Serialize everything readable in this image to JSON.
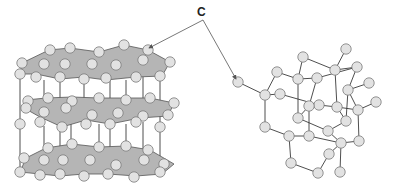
{
  "label": {
    "text": "C",
    "x": 197,
    "y": 5
  },
  "colors": {
    "atom_fill": "#e2e2e2",
    "atom_stroke": "#7a7a7a",
    "bond": "#3a3a3a",
    "sheet_fill": "#b5b5b5",
    "sheet_stroke": "#555555",
    "arrow": "#555555"
  },
  "arrows": [
    {
      "name": "arrow-to-graphite",
      "from": [
        203,
        20
      ],
      "to": [
        149,
        48
      ]
    },
    {
      "name": "arrow-to-diamond",
      "from": [
        203,
        20
      ],
      "to": [
        236,
        79
      ]
    }
  ],
  "graphite": {
    "name": "graphite-structure",
    "layers": [
      {
        "sheet": [
          [
            22,
            63
          ],
          [
            49,
            50
          ],
          [
            70,
            48
          ],
          [
            99,
            52
          ],
          [
            124,
            45
          ],
          [
            148,
            50
          ],
          [
            170,
            62
          ],
          [
            162,
            76
          ],
          [
            136,
            77
          ],
          [
            106,
            80
          ],
          [
            84,
            77
          ],
          [
            60,
            79
          ],
          [
            36,
            74
          ],
          [
            20,
            74
          ]
        ],
        "atoms": [
          [
            50,
            50
          ],
          [
            70,
            48
          ],
          [
            99,
            52
          ],
          [
            124,
            45
          ],
          [
            148,
            50
          ],
          [
            22,
            63
          ],
          [
            44,
            64
          ],
          [
            65,
            64
          ],
          [
            92,
            64
          ],
          [
            116,
            65
          ],
          [
            143,
            60
          ],
          [
            170,
            62
          ],
          [
            20,
            74
          ],
          [
            36,
            77
          ],
          [
            60,
            77
          ],
          [
            84,
            79
          ],
          [
            106,
            78
          ],
          [
            136,
            77
          ],
          [
            160,
            76
          ]
        ]
      },
      {
        "sheet": [
          [
            26,
            100
          ],
          [
            46,
            98
          ],
          [
            72,
            97
          ],
          [
            99,
            98
          ],
          [
            126,
            98
          ],
          [
            150,
            98
          ],
          [
            174,
            103
          ],
          [
            168,
            116
          ],
          [
            140,
            118
          ],
          [
            110,
            124
          ],
          [
            86,
            120
          ],
          [
            62,
            127
          ],
          [
            40,
            117
          ],
          [
            24,
            108
          ]
        ],
        "atoms": [
          [
            28,
            101
          ],
          [
            48,
            98
          ],
          [
            72,
            101
          ],
          [
            99,
            98
          ],
          [
            126,
            100
          ],
          [
            150,
            98
          ],
          [
            174,
            103
          ],
          [
            26,
            108
          ],
          [
            44,
            112
          ],
          [
            66,
            108
          ],
          [
            92,
            115
          ],
          [
            118,
            113
          ],
          [
            143,
            116
          ],
          [
            168,
            115
          ],
          [
            20,
            124
          ],
          [
            40,
            122
          ],
          [
            62,
            127
          ],
          [
            86,
            124
          ],
          [
            110,
            124
          ],
          [
            136,
            122
          ],
          [
            160,
            127
          ]
        ]
      },
      {
        "sheet": [
          [
            26,
            158
          ],
          [
            46,
            148
          ],
          [
            72,
            144
          ],
          [
            99,
            147
          ],
          [
            126,
            146
          ],
          [
            150,
            150
          ],
          [
            174,
            164
          ],
          [
            162,
            174
          ],
          [
            136,
            176
          ],
          [
            108,
            174
          ],
          [
            84,
            174
          ],
          [
            60,
            176
          ],
          [
            40,
            174
          ],
          [
            20,
            172
          ]
        ],
        "atoms": [
          [
            48,
            148
          ],
          [
            72,
            144
          ],
          [
            99,
            147
          ],
          [
            126,
            146
          ],
          [
            148,
            150
          ],
          [
            24,
            158
          ],
          [
            44,
            160
          ],
          [
            63,
            160
          ],
          [
            90,
            160
          ],
          [
            116,
            165
          ],
          [
            144,
            160
          ],
          [
            164,
            164
          ],
          [
            20,
            172
          ],
          [
            40,
            175
          ],
          [
            60,
            174
          ],
          [
            84,
            176
          ],
          [
            108,
            174
          ],
          [
            134,
            177
          ],
          [
            160,
            172
          ]
        ]
      }
    ],
    "pillars": [
      [
        [
          20,
          74
        ],
        [
          20,
          172
        ]
      ],
      [
        [
          44,
          80
        ],
        [
          44,
          112
        ]
      ],
      [
        [
          60,
          79
        ],
        [
          60,
          174
        ]
      ],
      [
        [
          71,
          104
        ],
        [
          71,
          158
        ]
      ],
      [
        [
          84,
          82
        ],
        [
          84,
          112
        ]
      ],
      [
        [
          110,
          80
        ],
        [
          110,
          174
        ]
      ],
      [
        [
          126,
          80
        ],
        [
          126,
          112
        ]
      ],
      [
        [
          143,
          77
        ],
        [
          143,
          116
        ]
      ],
      [
        [
          160,
          79
        ],
        [
          160,
          172
        ]
      ],
      [
        [
          44,
          126
        ],
        [
          44,
          160
        ]
      ],
      [
        [
          126,
          124
        ],
        [
          126,
          146
        ]
      ],
      [
        [
          143,
          122
        ],
        [
          143,
          160
        ]
      ],
      [
        [
          99,
          124
        ],
        [
          99,
          147
        ]
      ]
    ]
  },
  "diamond": {
    "name": "diamond-structure",
    "atoms": [
      [
        238,
        82
      ],
      [
        265,
        95
      ],
      [
        277,
        72
      ],
      [
        298,
        79
      ],
      [
        303,
        57
      ],
      [
        280,
        94
      ],
      [
        317,
        78
      ],
      [
        335,
        70
      ],
      [
        346,
        49
      ],
      [
        357,
        67
      ],
      [
        348,
        90
      ],
      [
        369,
        83
      ],
      [
        376,
        102
      ],
      [
        358,
        110
      ],
      [
        337,
        107
      ],
      [
        319,
        105
      ],
      [
        309,
        106
      ],
      [
        298,
        118
      ],
      [
        265,
        127
      ],
      [
        289,
        136
      ],
      [
        309,
        136
      ],
      [
        328,
        131
      ],
      [
        346,
        121
      ],
      [
        341,
        143
      ],
      [
        359,
        141
      ],
      [
        329,
        154
      ],
      [
        291,
        163
      ],
      [
        318,
        173
      ],
      [
        340,
        172
      ]
    ],
    "bonds": [
      [
        0,
        1
      ],
      [
        1,
        2
      ],
      [
        2,
        3
      ],
      [
        3,
        4
      ],
      [
        4,
        7
      ],
      [
        7,
        8
      ],
      [
        7,
        9
      ],
      [
        9,
        10
      ],
      [
        10,
        11
      ],
      [
        12,
        13
      ],
      [
        3,
        6
      ],
      [
        6,
        16
      ],
      [
        1,
        5
      ],
      [
        5,
        15
      ],
      [
        15,
        14
      ],
      [
        14,
        13
      ],
      [
        13,
        10
      ],
      [
        7,
        14
      ],
      [
        3,
        17
      ],
      [
        1,
        18
      ],
      [
        18,
        19
      ],
      [
        19,
        20
      ],
      [
        17,
        16
      ],
      [
        16,
        20
      ],
      [
        17,
        21
      ],
      [
        21,
        22
      ],
      [
        22,
        14
      ],
      [
        21,
        23
      ],
      [
        23,
        24
      ],
      [
        24,
        13
      ],
      [
        19,
        26
      ],
      [
        26,
        27
      ],
      [
        27,
        25
      ],
      [
        25,
        23
      ],
      [
        23,
        28
      ],
      [
        10,
        22
      ],
      [
        20,
        23
      ],
      [
        6,
        9
      ]
    ]
  }
}
